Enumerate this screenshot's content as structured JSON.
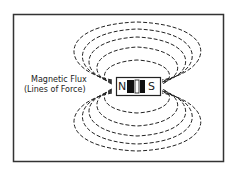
{
  "diagram": {
    "label_line1": "Magnetic Flux",
    "label_line2": "(Lines of Force)",
    "magnet": {
      "north": "N",
      "south": "S"
    },
    "colors": {
      "line": "#222222",
      "background": "#ffffff"
    }
  }
}
